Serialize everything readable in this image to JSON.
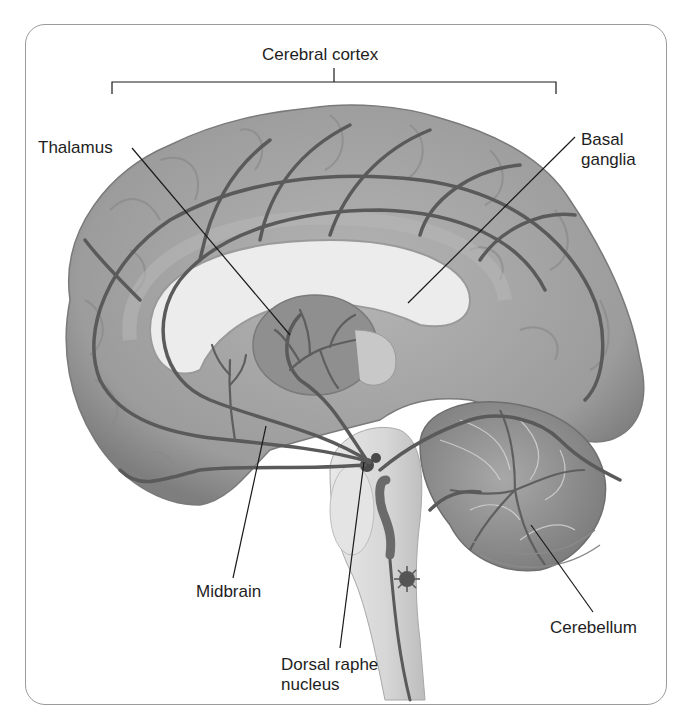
{
  "diagram": {
    "labels": {
      "cerebral_cortex": "Cerebral cortex",
      "thalamus": "Thalamus",
      "basal_ganglia": "Basal\nganglia",
      "midbrain": "Midbrain",
      "dorsal_raphe_nucleus": "Dorsal raphe\nnucleus",
      "cerebellum": "Cerebellum"
    },
    "colors": {
      "frame": "#9a9a9a",
      "cortex": "#a3a3a3",
      "cortex_dark": "#8a8a8a",
      "pathway": "#5a5a5a",
      "ventricle": "#e6e6e6",
      "thalamus": "#8f8f8f",
      "brainstem": "#dedede",
      "leader": "#1a1a1a"
    }
  }
}
